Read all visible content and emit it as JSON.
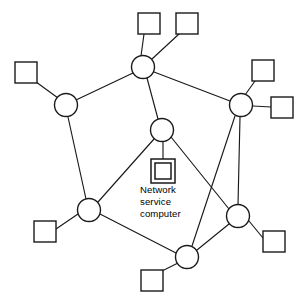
{
  "diagram": {
    "background_color": "#ffffff",
    "line_color": "#1a1a1a",
    "node_fill": "#ffffff",
    "label": {
      "name": "network-service-computer-label",
      "lines": [
        "Network",
        "service",
        "computer"
      ],
      "x": 140,
      "y": 193,
      "line_height": 12.2
    },
    "server": {
      "name": "network-service-computer",
      "outer": {
        "x": 151,
        "y": 159,
        "w": 24,
        "h": 24
      },
      "inner": {
        "x": 155,
        "y": 163,
        "w": 16,
        "h": 16
      }
    },
    "nodes": [
      {
        "id": "n-top",
        "name": "node-top",
        "cx": 143,
        "cy": 67,
        "r": 11.5
      },
      {
        "id": "n-left",
        "name": "node-left",
        "cx": 66,
        "cy": 105,
        "r": 11.5
      },
      {
        "id": "n-right",
        "name": "node-right",
        "cx": 241,
        "cy": 105,
        "r": 11.5
      },
      {
        "id": "n-center",
        "name": "node-center",
        "cx": 162,
        "cy": 130,
        "r": 11.5
      },
      {
        "id": "n-lower-left",
        "name": "node-lower-left",
        "cx": 89,
        "cy": 210,
        "r": 11.5
      },
      {
        "id": "n-lower-right",
        "name": "node-lower-right",
        "cx": 238,
        "cy": 216,
        "r": 11.5
      },
      {
        "id": "n-bottom",
        "name": "node-bottom",
        "cx": 187,
        "cy": 257,
        "r": 11.5
      }
    ],
    "terminals": [
      {
        "id": "t-top-left",
        "name": "terminal-top-left",
        "x": 138,
        "y": 13,
        "w": 22,
        "h": 21
      },
      {
        "id": "t-top-right",
        "name": "terminal-top-right",
        "x": 176,
        "y": 13,
        "w": 22,
        "h": 21
      },
      {
        "id": "t-left",
        "name": "terminal-left",
        "x": 15,
        "y": 62,
        "w": 22,
        "h": 21
      },
      {
        "id": "t-right-upper",
        "name": "terminal-right-upper",
        "x": 252,
        "y": 60,
        "w": 22,
        "h": 21
      },
      {
        "id": "t-right-mid",
        "name": "terminal-right-middle",
        "x": 271,
        "y": 97,
        "w": 22,
        "h": 21
      },
      {
        "id": "t-lower-left",
        "name": "terminal-lower-left",
        "x": 34,
        "y": 221,
        "w": 22,
        "h": 21
      },
      {
        "id": "t-lower-right",
        "name": "terminal-lower-right",
        "x": 263,
        "y": 231,
        "w": 22,
        "h": 21
      },
      {
        "id": "t-bottom",
        "name": "terminal-bottom",
        "x": 141,
        "y": 270,
        "w": 22,
        "h": 21
      }
    ],
    "edges": [
      {
        "name": "edge-top-to-left",
        "x1": 133,
        "y1": 73,
        "x2": 76,
        "y2": 100
      },
      {
        "name": "edge-top-to-right",
        "x1": 154,
        "y1": 72,
        "x2": 230,
        "y2": 101
      },
      {
        "name": "edge-top-to-center",
        "x1": 147,
        "y1": 78,
        "x2": 158,
        "y2": 119
      },
      {
        "name": "edge-left-to-lower-left",
        "x1": 68,
        "y1": 117,
        "x2": 86,
        "y2": 199
      },
      {
        "name": "edge-center-to-lower-left",
        "x1": 154,
        "y1": 139,
        "x2": 98,
        "y2": 202
      },
      {
        "name": "edge-center-to-lower-right",
        "x1": 171,
        "y1": 137,
        "x2": 229,
        "y2": 209
      },
      {
        "name": "edge-right-to-lower-right",
        "x1": 240,
        "y1": 117,
        "x2": 238,
        "y2": 205
      },
      {
        "name": "edge-right-to-bottom",
        "x1": 235,
        "y1": 116,
        "x2": 192,
        "y2": 246
      },
      {
        "name": "edge-lower-left-to-bottom",
        "x1": 100,
        "y1": 214,
        "x2": 176,
        "y2": 253
      },
      {
        "name": "edge-lower-right-to-bottom",
        "x1": 229,
        "y1": 224,
        "x2": 197,
        "y2": 250
      },
      {
        "name": "edge-terminal-top-left",
        "x1": 144,
        "y1": 34,
        "x2": 141,
        "y2": 56
      },
      {
        "name": "edge-terminal-top-right",
        "x1": 179,
        "y1": 34,
        "x2": 152,
        "y2": 59
      },
      {
        "name": "edge-terminal-left",
        "x1": 32,
        "y1": 79,
        "x2": 58,
        "y2": 98
      },
      {
        "name": "edge-terminal-right-upper",
        "x1": 255,
        "y1": 81,
        "x2": 245,
        "y2": 95
      },
      {
        "name": "edge-terminal-right-middle",
        "x1": 271,
        "y1": 107,
        "x2": 253,
        "y2": 106
      },
      {
        "name": "edge-terminal-lower-left",
        "x1": 56,
        "y1": 229,
        "x2": 78,
        "y2": 214
      },
      {
        "name": "edge-terminal-lower-right",
        "x1": 263,
        "y1": 238,
        "x2": 249,
        "y2": 221
      },
      {
        "name": "edge-terminal-bottom",
        "x1": 160,
        "y1": 272,
        "x2": 178,
        "y2": 263
      },
      {
        "name": "edge-center-to-server",
        "x1": 163,
        "y1": 142,
        "x2": 163,
        "y2": 159
      }
    ]
  }
}
